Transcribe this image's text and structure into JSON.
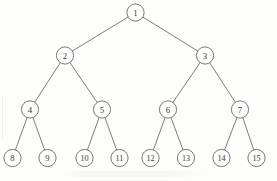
{
  "figure": {
    "background_color": "#fdfdfc",
    "stroke_color": "#6a6a6a",
    "label_color": "#3a3a3a",
    "width": 277,
    "height": 181
  },
  "chart_data": {
    "type": "diagram",
    "diagram_type": "binary-tree",
    "levels": 4,
    "node_count": 15,
    "node_radius": 8.6,
    "nodes": [
      {
        "id": 1,
        "label": "1",
        "level": 0,
        "x": 135.5,
        "y": 12.5,
        "r": 8.6
      },
      {
        "id": 2,
        "label": "2",
        "level": 1,
        "x": 65.0,
        "y": 55.5,
        "r": 8.6
      },
      {
        "id": 3,
        "label": "3",
        "level": 1,
        "x": 205.0,
        "y": 55.5,
        "r": 8.6
      },
      {
        "id": 4,
        "label": "4",
        "level": 2,
        "x": 30.0,
        "y": 109.5,
        "r": 8.6
      },
      {
        "id": 5,
        "label": "5",
        "level": 2,
        "x": 102.0,
        "y": 109.5,
        "r": 8.6
      },
      {
        "id": 6,
        "label": "6",
        "level": 2,
        "x": 168.0,
        "y": 109.5,
        "r": 8.6
      },
      {
        "id": 7,
        "label": "7",
        "level": 2,
        "x": 240.0,
        "y": 109.5,
        "r": 8.6
      },
      {
        "id": 8,
        "label": "8",
        "level": 3,
        "x": 12.5,
        "y": 158.0,
        "r": 8.6
      },
      {
        "id": 9,
        "label": "9",
        "level": 3,
        "x": 47.5,
        "y": 158.0,
        "r": 8.6
      },
      {
        "id": 10,
        "label": "10",
        "level": 3,
        "x": 84.5,
        "y": 158.0,
        "r": 8.6
      },
      {
        "id": 11,
        "label": "11",
        "level": 3,
        "x": 119.5,
        "y": 158.0,
        "r": 8.6
      },
      {
        "id": 12,
        "label": "12",
        "level": 3,
        "x": 150.5,
        "y": 158.0,
        "r": 8.6
      },
      {
        "id": 13,
        "label": "13",
        "level": 3,
        "x": 186.0,
        "y": 158.0,
        "r": 8.6
      },
      {
        "id": 14,
        "label": "14",
        "level": 3,
        "x": 221.5,
        "y": 158.0,
        "r": 8.6
      },
      {
        "id": 15,
        "label": "15",
        "level": 3,
        "x": 256.5,
        "y": 158.0,
        "r": 8.6
      }
    ],
    "edges": [
      {
        "from": 1,
        "to": 2
      },
      {
        "from": 1,
        "to": 3
      },
      {
        "from": 2,
        "to": 4
      },
      {
        "from": 2,
        "to": 5
      },
      {
        "from": 3,
        "to": 6
      },
      {
        "from": 3,
        "to": 7
      },
      {
        "from": 4,
        "to": 8
      },
      {
        "from": 4,
        "to": 9
      },
      {
        "from": 5,
        "to": 10
      },
      {
        "from": 5,
        "to": 11
      },
      {
        "from": 6,
        "to": 12
      },
      {
        "from": 6,
        "to": 13
      },
      {
        "from": 7,
        "to": 14
      },
      {
        "from": 7,
        "to": 15
      }
    ]
  }
}
